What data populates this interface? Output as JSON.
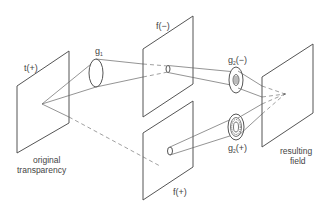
{
  "diagram": {
    "labels": {
      "t_plane": "t(+)",
      "g1": "g",
      "g1_sub": "1",
      "f_minus": "f(−)",
      "f_plus": "f(+)",
      "g2_minus_base": "g",
      "g2_minus_sub": "2",
      "g2_minus_suffix": "(−)",
      "g2_plus_base": "g",
      "g2_plus_sub": "2",
      "g2_plus_suffix": "(+)",
      "original_line1": "original",
      "original_line2": "transparency",
      "result_line1": "resulting",
      "result_line2": "field"
    },
    "stroke_color": "#555555",
    "background": "#ffffff"
  }
}
